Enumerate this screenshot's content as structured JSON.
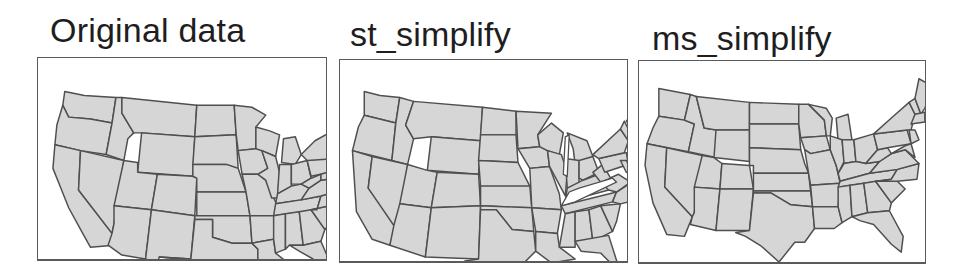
{
  "figure": {
    "panels": [
      {
        "id": "original",
        "title": "Original data",
        "description": "Contiguous US states, full-resolution boundaries"
      },
      {
        "id": "st_simplify",
        "title": "st_simplify",
        "description": "US states simplified per-polygon; gaps and overlaps appear between neighbors"
      },
      {
        "id": "ms_simplify",
        "title": "ms_simplify",
        "description": "US states simplified with shared topology preserved; no gaps"
      }
    ],
    "colors": {
      "state_fill": "#d6d6d6",
      "state_border": "#4f4f4f",
      "frame_border": "#5a5a5a",
      "background": "#ffffff",
      "title_text": "#1e1e1e"
    }
  }
}
